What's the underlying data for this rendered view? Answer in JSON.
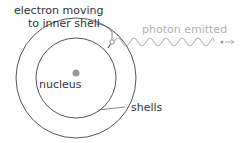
{
  "diagram": {
    "labels": {
      "electron": "electron moving",
      "electron_line2": "to inner shell",
      "photon": "photon emitted",
      "nucleus": "nucleus",
      "shells": "shells"
    },
    "colors": {
      "line": "#555555",
      "nucleus": "#999999",
      "photon": "#999999",
      "photon_text": "#b0b0b0"
    }
  }
}
